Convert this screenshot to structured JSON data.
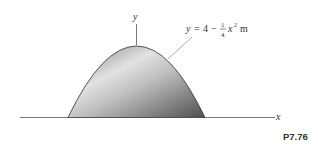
{
  "figure": {
    "label": "P7.76",
    "axes": {
      "x_label": "x",
      "y_label": "y"
    },
    "equation": {
      "lhs": "y",
      "equals": "=",
      "constant": "4",
      "minus": "−",
      "frac_num": "1",
      "frac_den": "4",
      "var": "x",
      "exponent": "2",
      "unit": "m"
    },
    "shape": {
      "type": "parabolic area",
      "fill_light": "#e6e6e6",
      "fill_dark": "#5a5a5a",
      "outline": "#444444"
    }
  }
}
